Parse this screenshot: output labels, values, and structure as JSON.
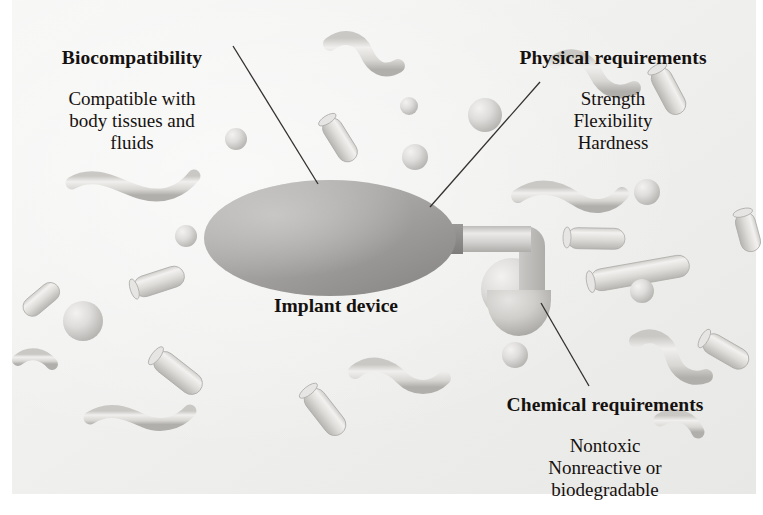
{
  "figure": {
    "background_color": "#ececea",
    "page_color": "#ffffff",
    "text_color": "#15110f",
    "leader_line_color": "#33302e"
  },
  "labels": {
    "biocompatibility": {
      "heading": "Biocompatibility",
      "body": "Compatible with\nbody tissues and\nfluids"
    },
    "physical": {
      "heading": "Physical requirements",
      "body": "Strength\nFlexibility\nHardness"
    },
    "chemical": {
      "heading": "Chemical requirements",
      "body": "Nontoxic\nNonreactive or\nbiodegradable"
    },
    "implant": {
      "caption": "Implant device"
    }
  },
  "device": {
    "body_shape": "ellipse",
    "body_fill_light": "#b9b8b6",
    "body_fill_dark": "#8e8d8b",
    "tube_fill": "#cfcecc",
    "dome_fill": "#c8c7c5",
    "body_bounds": {
      "cx": 330,
      "cy": 238,
      "rx": 126,
      "ry": 58
    },
    "tube_path": "horizontal then elbow down",
    "dome_bounds": {
      "cx": 519,
      "cy": 303,
      "r": 32
    }
  },
  "leader_lines": [
    {
      "name": "biocompatibility",
      "x1": 233,
      "y1": 46,
      "x2": 318,
      "y2": 184
    },
    {
      "name": "physical",
      "x1": 540,
      "y1": 82,
      "x2": 430,
      "y2": 207
    },
    {
      "name": "chemical",
      "x1": 541,
      "y1": 303,
      "x2": 589,
      "y2": 386
    }
  ],
  "microbes": {
    "fill_light": "#e0dfdd",
    "fill_mid": "#cfcecb",
    "fill_dark": "#b4b3b0",
    "outline": "#a9a8a5",
    "cocci": [
      {
        "cx": 236,
        "cy": 139,
        "r": 11
      },
      {
        "cx": 186,
        "cy": 236,
        "r": 11
      },
      {
        "cx": 415,
        "cy": 157,
        "r": 13
      },
      {
        "cx": 485,
        "cy": 115,
        "r": 17
      },
      {
        "cx": 409,
        "cy": 106,
        "r": 9
      },
      {
        "cx": 647,
        "cy": 192,
        "r": 13
      },
      {
        "cx": 642,
        "cy": 291,
        "r": 12
      },
      {
        "cx": 515,
        "cy": 355,
        "r": 13
      },
      {
        "cx": 83,
        "cy": 321,
        "r": 20
      },
      {
        "cx": 512,
        "cy": 289,
        "r": 31
      }
    ],
    "bacilli": [
      {
        "cx": 340,
        "cy": 140,
        "w": 48,
        "h": 20,
        "rot": 58
      },
      {
        "cx": 669,
        "cy": 91,
        "w": 50,
        "h": 21,
        "rot": 62
      },
      {
        "cx": 159,
        "cy": 281,
        "w": 52,
        "h": 21,
        "rot": -18
      },
      {
        "cx": 178,
        "cy": 373,
        "w": 56,
        "h": 22,
        "rot": 38
      },
      {
        "cx": 596,
        "cy": 238,
        "w": 58,
        "h": 21,
        "rot": 1
      },
      {
        "cx": 640,
        "cy": 273,
        "w": 100,
        "h": 22,
        "rot": -10
      },
      {
        "cx": 325,
        "cy": 412,
        "w": 54,
        "h": 22,
        "rot": 52
      },
      {
        "cx": 726,
        "cy": 351,
        "w": 50,
        "h": 21,
        "rot": 30
      },
      {
        "cx": 745,
        "cy": 232,
        "w": 40,
        "h": 20,
        "rot": 75
      }
    ],
    "vibrios": [
      {
        "name": "top-right-1",
        "path": "M 330,44 C 344,33 360,38 366,52 C 373,68 384,74 398,66",
        "w": 14
      },
      {
        "name": "top-right-2",
        "path": "M 555,62 C 572,50 588,58 596,74 C 604,90 618,96 634,88",
        "w": 14
      },
      {
        "name": "mid-left",
        "path": "M 72,183 C 96,169 118,186 142,193 C 164,199 182,191 194,176",
        "w": 13
      },
      {
        "name": "mid-right",
        "path": "M 518,196 C 540,181 560,188 576,199 C 592,210 610,208 622,194",
        "w": 14
      },
      {
        "name": "lower-left",
        "path": "M 90,418 C 110,405 128,414 144,421 C 160,428 178,424 190,411",
        "w": 13
      },
      {
        "name": "lower-mid",
        "path": "M 355,372 C 372,358 390,366 402,378 C 414,390 432,390 444,378",
        "w": 14
      },
      {
        "name": "lower-right",
        "path": "M 636,341 C 652,330 668,340 672,356 C 676,372 690,382 706,376",
        "w": 14
      },
      {
        "name": "bottom-right",
        "path": "M 660,420 C 676,410 692,418 698,432",
        "w": 13
      }
    ]
  }
}
